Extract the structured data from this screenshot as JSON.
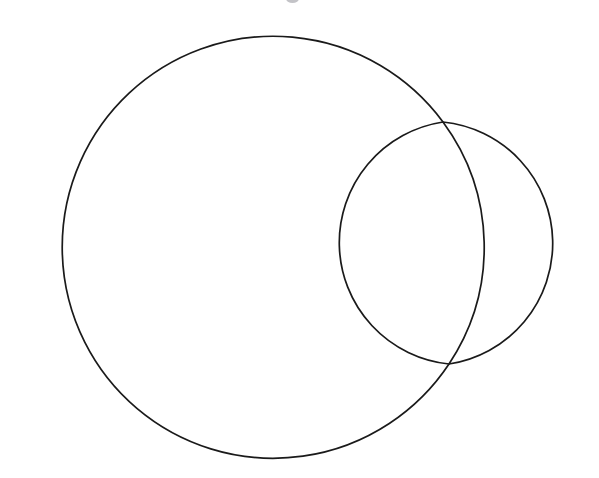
{
  "page": {
    "background_color": "#ffffff",
    "width": 599,
    "height": 478
  },
  "style": {
    "stroke_color": "#1a1a1a",
    "stroke_width": 1.7,
    "fill": "none"
  },
  "chart_data": {
    "type": "diagram",
    "title": "",
    "subtitle": "",
    "xlabel": "",
    "ylabel": "",
    "grid": false,
    "legend": "none",
    "shapes": [
      {
        "name": "large-circle",
        "kind": "circle",
        "cx": 250,
        "cy": 244,
        "r": 211,
        "stroke": "#1a1a1a",
        "fill": "none",
        "extents": {
          "left": 39,
          "right": 461,
          "top": 33,
          "bottom": 455
        }
      },
      {
        "name": "small-circle",
        "kind": "circle",
        "cx": 450,
        "cy": 243,
        "r": 122,
        "stroke": "#1a1a1a",
        "fill": "none",
        "extents": {
          "left": 328,
          "right": 572,
          "top": 121,
          "bottom": 365
        }
      }
    ],
    "intersections": [
      {
        "name": "upper-junction",
        "x": 443,
        "y": 122
      },
      {
        "name": "lower-junction",
        "x": 449,
        "y": 364
      }
    ],
    "regions": [
      {
        "name": "large-circle-only",
        "label": ""
      },
      {
        "name": "lens-overlap",
        "label": ""
      },
      {
        "name": "small-circle-only",
        "label": ""
      }
    ]
  },
  "artifact": {
    "name": "top-edge-smudge",
    "x": 286,
    "y": -6,
    "color": "#b9b9bd"
  }
}
